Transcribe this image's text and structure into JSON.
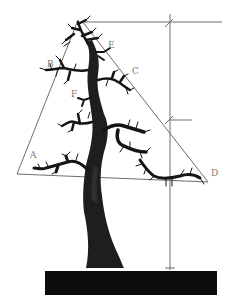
{
  "diagram": {
    "labels": {
      "A": "A",
      "B": "B",
      "C": "C",
      "D": "D",
      "E": "E",
      "F": "F"
    },
    "colors": {
      "background": "#ffffff",
      "guide_lines": "#6e6e6e",
      "tree": "#151515",
      "pot": "#0d0d0d",
      "label_text": "#7a7a7a"
    },
    "measurement_marks": 3
  }
}
